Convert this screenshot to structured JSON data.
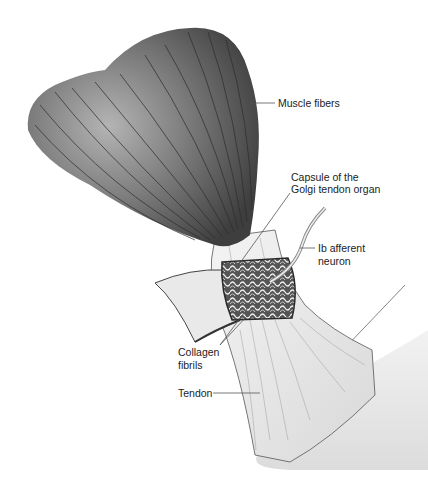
{
  "figure": {
    "subject": "Golgi tendon organ",
    "labels": {
      "muscle_fibers": "Muscle fibers",
      "capsule_line1": "Capsule of the",
      "capsule_line2": "Golgi tendon organ",
      "ib_line1": "Ib afferent",
      "ib_line2": "neuron",
      "collagen_line1": "Collagen",
      "collagen_line2": "fibrils",
      "tendon": "Tendon"
    },
    "colors": {
      "muscle_dark": "#4a4a4a",
      "muscle_light": "#9a9a9a",
      "tendon": "#efefef",
      "capsule": "#3a3a3a",
      "bone_shadow": "#e2e2e2",
      "text": "#222222"
    }
  }
}
